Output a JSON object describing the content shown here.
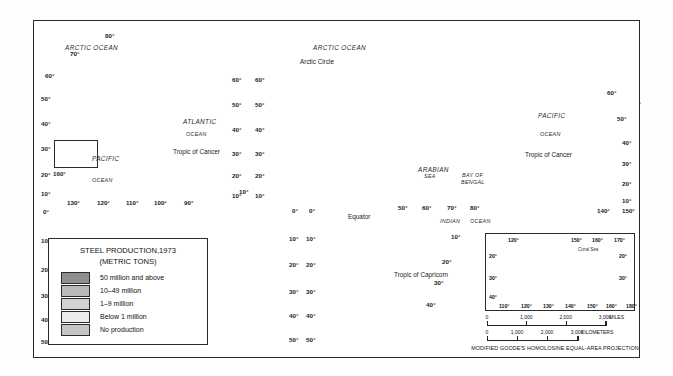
{
  "map": {
    "title": "World map of steel production 1973",
    "projection_note": "MODIFIED GOODE'S HOMOLOSINE EQUAL-AREA PROJECTION"
  },
  "legend": {
    "title_line1": "STEEL PRODUCTION,1973",
    "title_line2": "(METRIC TONS)",
    "classes": [
      {
        "label": "50 million and above",
        "color": "#8f8f8f"
      },
      {
        "label": "10–49 million",
        "color": "#b9b9b9"
      },
      {
        "label": "1–9 million",
        "color": "#d2d2d2"
      },
      {
        "label": "Below 1 million",
        "color": "#ececec"
      },
      {
        "label": "No production",
        "color": "#c6c6c6"
      }
    ]
  },
  "ocean_labels": [
    {
      "text": "ARCTIC OCEAN",
      "x": 65,
      "y": 44
    },
    {
      "text": "ATLANTIC",
      "x": 183,
      "y": 118
    },
    {
      "text": "OCEAN",
      "x": 186,
      "y": 131
    },
    {
      "text": "PACIFIC",
      "x": 92,
      "y": 155
    },
    {
      "text": "OCEAN",
      "x": 92,
      "y": 177
    },
    {
      "text": "ARCTIC OCEAN",
      "x": 313,
      "y": 44
    },
    {
      "text": "PACIFIC",
      "x": 538,
      "y": 112
    },
    {
      "text": "OCEAN",
      "x": 540,
      "y": 131
    },
    {
      "text": "INDIAN",
      "x": 440,
      "y": 218
    },
    {
      "text": "OCEAN",
      "x": 470,
      "y": 218
    },
    {
      "text": "ARABIAN",
      "x": 418,
      "y": 166
    },
    {
      "text": "SEA",
      "x": 424,
      "y": 173
    },
    {
      "text": "BAY OF",
      "x": 462,
      "y": 172
    },
    {
      "text": "BENGAL",
      "x": 461,
      "y": 179
    }
  ],
  "line_labels": [
    {
      "text": "Arctic Circle",
      "x": 300,
      "y": 58
    },
    {
      "text": "Tropic of Cancer",
      "x": 173,
      "y": 148
    },
    {
      "text": "Tropic of Cancer",
      "x": 525,
      "y": 151
    },
    {
      "text": "Equator",
      "x": 348,
      "y": 213
    },
    {
      "text": "Tropic of Capricorn",
      "x": 394,
      "y": 271
    }
  ],
  "graticule_labels": [
    {
      "text": "80°",
      "x": 105,
      "y": 32
    },
    {
      "text": "70°",
      "x": 70,
      "y": 50
    },
    {
      "text": "60°",
      "x": 45,
      "y": 72
    },
    {
      "text": "50°",
      "x": 41,
      "y": 95
    },
    {
      "text": "40°",
      "x": 41,
      "y": 120
    },
    {
      "text": "30°",
      "x": 41,
      "y": 145
    },
    {
      "text": "20°",
      "x": 41,
      "y": 171
    },
    {
      "text": "10°",
      "x": 41,
      "y": 190
    },
    {
      "text": "0°",
      "x": 43,
      "y": 208
    },
    {
      "text": "10°",
      "x": 41,
      "y": 237
    },
    {
      "text": "20°",
      "x": 41,
      "y": 266
    },
    {
      "text": "30°",
      "x": 41,
      "y": 292
    },
    {
      "text": "40°",
      "x": 41,
      "y": 316
    },
    {
      "text": "50°",
      "x": 41,
      "y": 338
    },
    {
      "text": "160°",
      "x": 53,
      "y": 170
    },
    {
      "text": "130°",
      "x": 67,
      "y": 199
    },
    {
      "text": "120°",
      "x": 97,
      "y": 199
    },
    {
      "text": "110°",
      "x": 126,
      "y": 199
    },
    {
      "text": "100°",
      "x": 154,
      "y": 199
    },
    {
      "text": "90°",
      "x": 184,
      "y": 199
    },
    {
      "text": "60°",
      "x": 232,
      "y": 76
    },
    {
      "text": "50°",
      "x": 232,
      "y": 101
    },
    {
      "text": "40°",
      "x": 232,
      "y": 126
    },
    {
      "text": "30°",
      "x": 232,
      "y": 150
    },
    {
      "text": "20°",
      "x": 232,
      "y": 172
    },
    {
      "text": "10°",
      "x": 232,
      "y": 192
    },
    {
      "text": "60°",
      "x": 255,
      "y": 76
    },
    {
      "text": "50°",
      "x": 255,
      "y": 101
    },
    {
      "text": "40°",
      "x": 255,
      "y": 126
    },
    {
      "text": "30°",
      "x": 255,
      "y": 150
    },
    {
      "text": "20°",
      "x": 255,
      "y": 172
    },
    {
      "text": "10°",
      "x": 255,
      "y": 192
    },
    {
      "text": "10°",
      "x": 239,
      "y": 188
    },
    {
      "text": "0°",
      "x": 292,
      "y": 207
    },
    {
      "text": "10°",
      "x": 289,
      "y": 235
    },
    {
      "text": "20°",
      "x": 289,
      "y": 261
    },
    {
      "text": "30°",
      "x": 289,
      "y": 288
    },
    {
      "text": "40°",
      "x": 289,
      "y": 312
    },
    {
      "text": "50°",
      "x": 289,
      "y": 336
    },
    {
      "text": "0°",
      "x": 309,
      "y": 207
    },
    {
      "text": "10°",
      "x": 306,
      "y": 235
    },
    {
      "text": "20°",
      "x": 306,
      "y": 261
    },
    {
      "text": "30°",
      "x": 306,
      "y": 288
    },
    {
      "text": "40°",
      "x": 306,
      "y": 312
    },
    {
      "text": "50°",
      "x": 306,
      "y": 336
    },
    {
      "text": "50°",
      "x": 398,
      "y": 204
    },
    {
      "text": "60°",
      "x": 422,
      "y": 204
    },
    {
      "text": "70°",
      "x": 447,
      "y": 204
    },
    {
      "text": "80°",
      "x": 470,
      "y": 204
    },
    {
      "text": "10°",
      "x": 451,
      "y": 233
    },
    {
      "text": "20°",
      "x": 442,
      "y": 258
    },
    {
      "text": "30°",
      "x": 434,
      "y": 279
    },
    {
      "text": "40°",
      "x": 426,
      "y": 301
    },
    {
      "text": "60°",
      "x": 607,
      "y": 89
    },
    {
      "text": "50°",
      "x": 617,
      "y": 115
    },
    {
      "text": "40°",
      "x": 622,
      "y": 139
    },
    {
      "text": "30°",
      "x": 622,
      "y": 160
    },
    {
      "text": "20°",
      "x": 622,
      "y": 180
    },
    {
      "text": "10°",
      "x": 622,
      "y": 197
    },
    {
      "text": "140°",
      "x": 597,
      "y": 207
    },
    {
      "text": "150°",
      "x": 622,
      "y": 207
    }
  ],
  "inset": {
    "sea_label": "Coral Sea",
    "top_labels": [
      {
        "text": "120°",
        "x": 508,
        "y": 237
      },
      {
        "text": "150°",
        "x": 571,
        "y": 237
      },
      {
        "text": "160°",
        "x": 592,
        "y": 237
      },
      {
        "text": "170°",
        "x": 614,
        "y": 237
      }
    ],
    "side_labels": [
      {
        "text": "20°",
        "x": 489,
        "y": 253
      },
      {
        "text": "30°",
        "x": 489,
        "y": 275
      },
      {
        "text": "40°",
        "x": 489,
        "y": 294
      },
      {
        "text": "20°",
        "x": 619,
        "y": 253
      },
      {
        "text": "30°",
        "x": 619,
        "y": 275
      }
    ],
    "bottom_labels": [
      {
        "text": "110°",
        "x": 499,
        "y": 303
      },
      {
        "text": "120°",
        "x": 521,
        "y": 303
      },
      {
        "text": "130°",
        "x": 543,
        "y": 303
      },
      {
        "text": "140°",
        "x": 565,
        "y": 303
      },
      {
        "text": "150°",
        "x": 587,
        "y": 303
      },
      {
        "text": "160°",
        "x": 606,
        "y": 303
      },
      {
        "text": "180°",
        "x": 626,
        "y": 303
      }
    ]
  },
  "scale": {
    "miles": {
      "ticks": [
        "0",
        "1,000",
        "2,000",
        "3,000"
      ],
      "unit": "MILES"
    },
    "kilometers": {
      "ticks": [
        "0",
        "1,000",
        "2,000",
        "3,000"
      ],
      "unit": "KILOMETERS"
    }
  },
  "chart_data": {
    "type": "map",
    "title": "STEEL PRODUCTION,1973 (METRIC TONS)",
    "projection": "Modified Goode's homolosine equal-area",
    "classes": [
      {
        "label": "50 million and above",
        "color": "#8f8f8f"
      },
      {
        "label": "10-49 million",
        "color": "#b9b9b9"
      },
      {
        "label": "1-9 million",
        "color": "#d2d2d2"
      },
      {
        "label": "Below 1 million",
        "color": "#ececec"
      },
      {
        "label": "No production",
        "color": "#c6c6c6"
      }
    ],
    "regions": [
      {
        "name": "United States",
        "class": "50 million and above"
      },
      {
        "name": "Soviet Union",
        "class": "50 million and above"
      },
      {
        "name": "Japan",
        "class": "50 million and above"
      },
      {
        "name": "West Germany",
        "class": "50 million and above"
      },
      {
        "name": "China",
        "class": "10-49 million"
      },
      {
        "name": "Canada",
        "class": "10-49 million"
      },
      {
        "name": "France",
        "class": "10-49 million"
      },
      {
        "name": "United Kingdom",
        "class": "10-49 million"
      },
      {
        "name": "Italy",
        "class": "10-49 million"
      },
      {
        "name": "Poland",
        "class": "10-49 million"
      },
      {
        "name": "Czechoslovakia",
        "class": "10-49 million"
      },
      {
        "name": "Belgium",
        "class": "10-49 million"
      },
      {
        "name": "Brazil",
        "class": "1-9 million"
      },
      {
        "name": "India",
        "class": "1-9 million"
      },
      {
        "name": "Spain",
        "class": "1-9 million"
      },
      {
        "name": "Australia",
        "class": "1-9 million"
      },
      {
        "name": "South Africa",
        "class": "1-9 million"
      },
      {
        "name": "Mexico",
        "class": "1-9 million"
      },
      {
        "name": "Argentina",
        "class": "Below 1 million"
      },
      {
        "name": "Most of Africa",
        "class": "No production"
      }
    ]
  }
}
